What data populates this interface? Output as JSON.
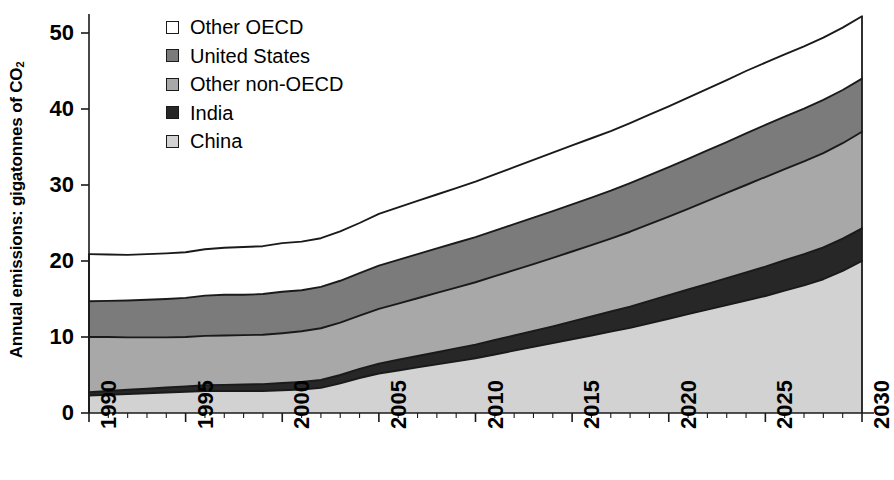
{
  "chart_data": {
    "type": "area",
    "stacked": true,
    "title": "",
    "subtitle": "",
    "xlabel": "",
    "ylabel": "Annual emissions: gigatonnes of CO2",
    "ylabel_display": "Annual emissions: gigatonnes of CO",
    "ylabel_subscript": "2",
    "x": [
      1990,
      1991,
      1992,
      1993,
      1994,
      1995,
      1996,
      1997,
      1998,
      1999,
      2000,
      2001,
      2002,
      2003,
      2004,
      2005,
      2006,
      2007,
      2008,
      2009,
      2010,
      2011,
      2012,
      2013,
      2014,
      2015,
      2016,
      2017,
      2018,
      2019,
      2020,
      2021,
      2022,
      2023,
      2024,
      2025,
      2026,
      2027,
      2028,
      2029,
      2030
    ],
    "xlim": [
      1990,
      2030
    ],
    "ylim": [
      0,
      55
    ],
    "yticks": [
      0,
      10,
      20,
      30,
      40,
      50
    ],
    "xticks": [
      1990,
      1995,
      2000,
      2005,
      2010,
      2015,
      2020,
      2025,
      2030
    ],
    "xtick_labels": [
      "1990",
      "1995",
      "2000",
      "2005",
      "2010",
      "2015",
      "2020",
      "2025",
      "2030"
    ],
    "ytick_labels": [
      "0",
      "10",
      "20",
      "30",
      "40",
      "50"
    ],
    "grid": false,
    "legend_position": "top-left",
    "stack_order_bottom_to_top": [
      "China",
      "India",
      "Other non-OECD",
      "United States",
      "Other OECD"
    ],
    "series": [
      {
        "name": "China",
        "color": "#d2d2d2",
        "values": [
          2.3,
          2.4,
          2.5,
          2.6,
          2.7,
          2.8,
          2.9,
          2.9,
          2.9,
          2.9,
          3.0,
          3.1,
          3.3,
          3.9,
          4.6,
          5.2,
          5.6,
          6.0,
          6.4,
          6.8,
          7.2,
          7.7,
          8.2,
          8.7,
          9.2,
          9.7,
          10.2,
          10.7,
          11.2,
          11.8,
          12.4,
          13.0,
          13.6,
          14.2,
          14.8,
          15.4,
          16.1,
          16.8,
          17.6,
          18.7,
          20.0
        ]
      },
      {
        "name": "India",
        "color": "#272727",
        "values": [
          0.45,
          0.5,
          0.55,
          0.6,
          0.65,
          0.7,
          0.75,
          0.8,
          0.85,
          0.9,
          0.95,
          1.0,
          1.05,
          1.1,
          1.2,
          1.3,
          1.4,
          1.5,
          1.6,
          1.7,
          1.8,
          1.9,
          2.0,
          2.1,
          2.2,
          2.35,
          2.5,
          2.65,
          2.8,
          2.95,
          3.1,
          3.25,
          3.4,
          3.55,
          3.7,
          3.85,
          4.0,
          4.1,
          4.2,
          4.25,
          4.3
        ]
      },
      {
        "name": "Other non-OECD",
        "color": "#a8a8a8",
        "values": [
          7.25,
          7.1,
          6.9,
          6.75,
          6.6,
          6.5,
          6.5,
          6.5,
          6.5,
          6.5,
          6.55,
          6.65,
          6.8,
          6.9,
          7.0,
          7.2,
          7.4,
          7.6,
          7.8,
          8.0,
          8.2,
          8.4,
          8.6,
          8.8,
          9.0,
          9.2,
          9.4,
          9.6,
          9.85,
          10.1,
          10.35,
          10.6,
          10.9,
          11.2,
          11.5,
          11.8,
          12.0,
          12.2,
          12.4,
          12.55,
          12.7
        ]
      },
      {
        "name": "United States",
        "color": "#7b7b7b",
        "values": [
          4.7,
          4.75,
          4.85,
          4.95,
          5.05,
          5.15,
          5.3,
          5.35,
          5.3,
          5.35,
          5.45,
          5.4,
          5.45,
          5.5,
          5.6,
          5.7,
          5.75,
          5.8,
          5.85,
          5.9,
          5.95,
          6.0,
          6.05,
          6.1,
          6.15,
          6.2,
          6.25,
          6.3,
          6.4,
          6.45,
          6.5,
          6.6,
          6.65,
          6.7,
          6.8,
          6.85,
          6.9,
          6.95,
          7.0,
          7.0,
          7.0
        ]
      },
      {
        "name": "Other OECD",
        "color": "#ffffff",
        "values": [
          6.2,
          6.1,
          6.0,
          6.0,
          6.0,
          6.0,
          6.1,
          6.2,
          6.3,
          6.3,
          6.4,
          6.4,
          6.4,
          6.5,
          6.6,
          6.8,
          6.9,
          7.0,
          7.1,
          7.2,
          7.3,
          7.4,
          7.5,
          7.6,
          7.7,
          7.75,
          7.8,
          7.85,
          7.9,
          7.95,
          8.0,
          8.05,
          8.1,
          8.15,
          8.2,
          8.2,
          8.2,
          8.2,
          8.2,
          8.2,
          8.2
        ]
      }
    ],
    "totals": [
      20.9,
      20.85,
      20.8,
      20.9,
      21.0,
      21.15,
      21.55,
      21.75,
      21.85,
      21.95,
      22.35,
      22.55,
      23.0,
      23.9,
      25.0,
      26.2,
      27.05,
      27.9,
      28.75,
      29.6,
      30.45,
      31.4,
      32.35,
      33.3,
      34.25,
      35.2,
      36.15,
      37.1,
      38.15,
      39.25,
      40.35,
      41.5,
      42.65,
      43.8,
      45.0,
      46.1,
      47.2,
      48.25,
      49.4,
      50.7,
      52.2
    ]
  },
  "legend": {
    "items": [
      {
        "label": "Other OECD",
        "color": "#ffffff"
      },
      {
        "label": "United States",
        "color": "#7b7b7b"
      },
      {
        "label": "Other non-OECD",
        "color": "#a8a8a8"
      },
      {
        "label": "India",
        "color": "#272727"
      },
      {
        "label": "China",
        "color": "#d2d2d2"
      }
    ]
  },
  "axes": {
    "y_title_main": "Annual emissions: gigatonnes of CO",
    "y_title_sub": "2",
    "y_tick_labels": [
      "50",
      "40",
      "30",
      "20",
      "10",
      "0"
    ],
    "x_tick_labels": [
      "1990",
      "1995",
      "2000",
      "2005",
      "2010",
      "2015",
      "2020",
      "2025",
      "2030"
    ]
  },
  "colors": {
    "axis": "#1a1a1a",
    "outline": "#1a1a1a",
    "background": "#ffffff"
  }
}
